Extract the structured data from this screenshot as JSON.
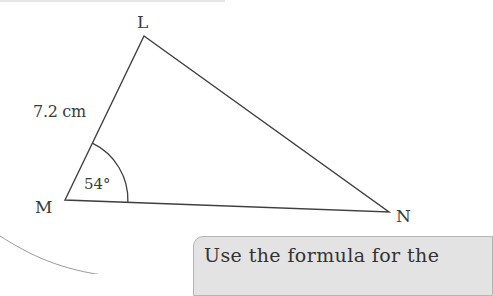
{
  "figure": {
    "type": "triangle",
    "vertices": {
      "L": {
        "label": "L",
        "x": 144,
        "y": 36
      },
      "M": {
        "label": "M",
        "x": 65,
        "y": 200
      },
      "N": {
        "label": "N",
        "x": 389,
        "y": 212
      }
    },
    "side_LM": {
      "label": "7.2 cm"
    },
    "angle_M": {
      "label": "54°"
    },
    "stroke_color": "#3f3f3f"
  },
  "hint": {
    "text": "Use the formula for the"
  },
  "colors": {
    "hint_fill": "#e3e3e3",
    "hint_border": "#b5b5b5"
  }
}
